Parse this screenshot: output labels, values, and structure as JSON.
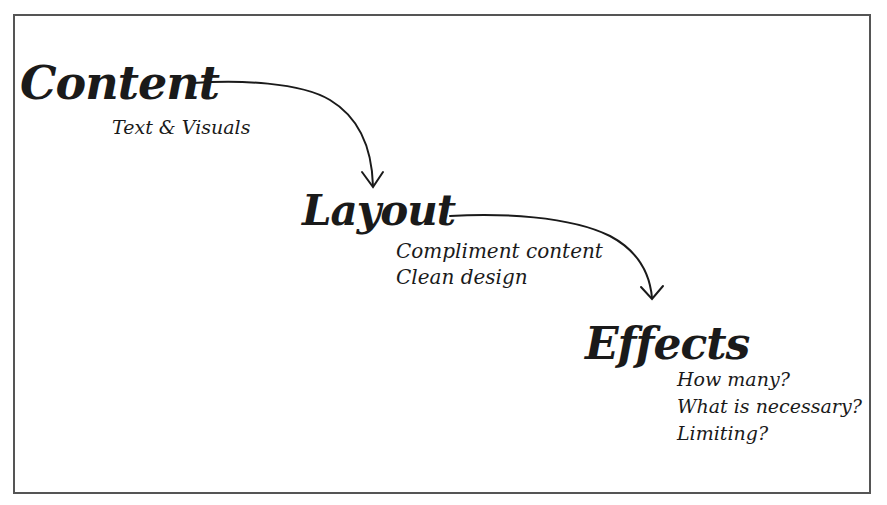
{
  "diagram": {
    "type": "flow",
    "colors": {
      "ink": "#1a1a1a",
      "border": "#555555",
      "background": "#ffffff"
    },
    "nodes": [
      {
        "id": "content",
        "title": "Content",
        "notes": [
          "Text & Visuals"
        ]
      },
      {
        "id": "layout",
        "title": "Layout",
        "notes": [
          "Compliment content",
          "Clean design"
        ]
      },
      {
        "id": "effects",
        "title": "Effects",
        "notes": [
          "How many?",
          "What is necessary?",
          "Limiting?"
        ]
      }
    ],
    "edges": [
      {
        "from": "content",
        "to": "layout",
        "icon": "curved-arrow-icon"
      },
      {
        "from": "layout",
        "to": "effects",
        "icon": "curved-arrow-icon"
      }
    ]
  }
}
